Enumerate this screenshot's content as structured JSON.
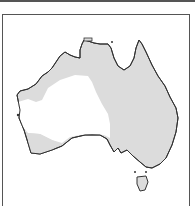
{
  "map": {
    "region": "Australia",
    "shaded_color": "#dcdcdc",
    "unshaded_color": "#ffffff",
    "outline_color": "#333333",
    "frame_color": "#555555"
  }
}
